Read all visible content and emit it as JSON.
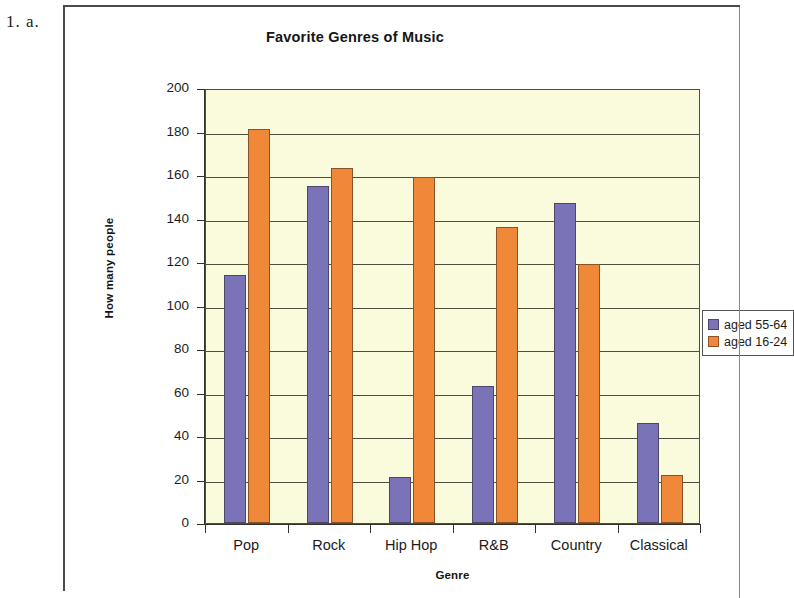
{
  "question_number": "1. a.",
  "chart_data": {
    "type": "bar",
    "title": "Favorite Genres of Music",
    "xlabel": "Genre",
    "ylabel": "How many people",
    "categories": [
      "Pop",
      "Rock",
      "Hip Hop",
      "R&B",
      "Country",
      "Classical"
    ],
    "series": [
      {
        "name": "aged 55-64",
        "color": "#7b73b8",
        "values": [
          114,
          155,
          21,
          63,
          147,
          46
        ]
      },
      {
        "name": "aged 16-24",
        "color": "#f0883a",
        "values": [
          181,
          163,
          159,
          136,
          119,
          22
        ]
      }
    ],
    "ylim": [
      0,
      200
    ],
    "yticks": [
      0,
      20,
      40,
      60,
      80,
      100,
      120,
      140,
      160,
      180,
      200
    ],
    "ytick_labels": [
      "0",
      "20",
      "40",
      "60",
      "80",
      "100",
      "120",
      "140",
      "160",
      "180",
      "200"
    ],
    "grid": true,
    "grid_axis": "y",
    "legend_position": "right",
    "plot_background": "#fafadc",
    "figure_background": "#ffffff"
  }
}
